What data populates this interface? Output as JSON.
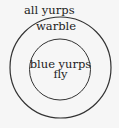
{
  "diagram": {
    "type": "euler",
    "sets": [
      {
        "id": "outer",
        "label": "all yurps",
        "sublabel": "warble",
        "contains": [
          "inner"
        ]
      },
      {
        "id": "inner",
        "label_line1": "blue yurps",
        "label_line2": "fly"
      }
    ]
  },
  "style": {
    "stroke": "#333333",
    "background": "#f6f6f6",
    "text": "#222222"
  }
}
